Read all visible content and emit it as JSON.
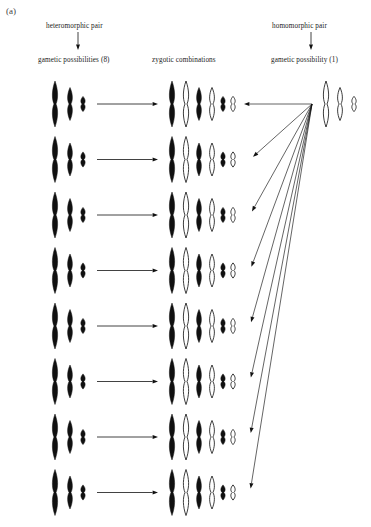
{
  "figure": {
    "panel_label": "(a)",
    "background": "#ffffff",
    "ink": "#111111"
  },
  "headers": {
    "left_top": "heteromorphic pair",
    "left_bottom": "gametic possibilities (8)",
    "middle": "zygotic combinations",
    "right_top": "homomorphic pair",
    "right_bottom": "gametic possibility (1)"
  },
  "chart_data": {
    "type": "diagram",
    "subtype": "chromosome-segregation-punnett",
    "n_gamete_rows": 8,
    "columns": [
      "gametic possibilities (8)",
      "zygotic combinations",
      "gametic possibility (1)"
    ],
    "chromosome_sizes": [
      "long",
      "medium",
      "small"
    ],
    "fill_legend": {
      "black": "paternal / heteromorphic-derived chromosome",
      "white": "maternal / homomorphic-derived chromosome"
    },
    "left_gametes": [
      {
        "row": 1,
        "fills": [
          "black",
          "black",
          "black"
        ]
      },
      {
        "row": 2,
        "fills": [
          "black",
          "black",
          "black"
        ]
      },
      {
        "row": 3,
        "fills": [
          "black",
          "black",
          "black"
        ]
      },
      {
        "row": 4,
        "fills": [
          "black",
          "black",
          "black"
        ]
      },
      {
        "row": 5,
        "fills": [
          "black",
          "black",
          "black"
        ]
      },
      {
        "row": 6,
        "fills": [
          "black",
          "black",
          "black"
        ]
      },
      {
        "row": 7,
        "fills": [
          "black",
          "black",
          "black"
        ]
      },
      {
        "row": 8,
        "fills": [
          "black",
          "black",
          "black"
        ]
      }
    ],
    "right_gamete": {
      "fills": [
        "white",
        "white",
        "white"
      ]
    },
    "zygotes": [
      {
        "row": 1,
        "fills": [
          "black",
          "white",
          "black",
          "white",
          "black",
          "white"
        ]
      },
      {
        "row": 2,
        "fills": [
          "black",
          "white",
          "black",
          "white",
          "black",
          "white"
        ]
      },
      {
        "row": 3,
        "fills": [
          "black",
          "white",
          "black",
          "white",
          "black",
          "white"
        ]
      },
      {
        "row": 4,
        "fills": [
          "black",
          "white",
          "black",
          "white",
          "black",
          "white"
        ]
      },
      {
        "row": 5,
        "fills": [
          "black",
          "white",
          "black",
          "white",
          "black",
          "white"
        ]
      },
      {
        "row": 6,
        "fills": [
          "black",
          "white",
          "black",
          "white",
          "black",
          "white"
        ]
      },
      {
        "row": 7,
        "fills": [
          "black",
          "white",
          "black",
          "white",
          "black",
          "white"
        ]
      },
      {
        "row": 8,
        "fills": [
          "black",
          "white",
          "black",
          "white",
          "black",
          "white"
        ]
      }
    ],
    "arrows": {
      "left_to_zygote_count": 8,
      "right_fan_count": 8,
      "fan_origin": [
        312,
        104
      ]
    }
  }
}
